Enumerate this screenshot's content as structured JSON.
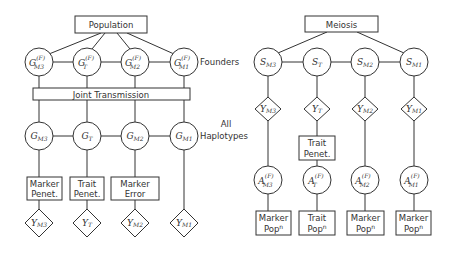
{
  "left": {
    "top_box": "Population",
    "founders_label": "Founders",
    "joint_box": "Joint Transmission",
    "all_label_1": "All",
    "all_label_2": "Haplotypes",
    "founder_nodes": [
      {
        "base": "G",
        "sup": "(F)",
        "sub": "M3"
      },
      {
        "base": "G",
        "sup": "(F)",
        "sub": "T"
      },
      {
        "base": "G",
        "sup": "(F)",
        "sub": "M2"
      },
      {
        "base": "G",
        "sup": "(F)",
        "sub": "M1"
      }
    ],
    "haplotype_nodes": [
      {
        "base": "G",
        "sub": "M3"
      },
      {
        "base": "G",
        "sub": "T"
      },
      {
        "base": "G",
        "sub": "M2"
      },
      {
        "base": "G",
        "sub": "M1"
      }
    ],
    "penet_boxes": [
      {
        "line1": "Marker",
        "line2": "Penet."
      },
      {
        "line1": "Trait",
        "line2": "Penet."
      },
      {
        "line1": "Marker",
        "line2": "Error"
      }
    ],
    "obs_nodes": [
      {
        "base": "Y",
        "sub": "M3"
      },
      {
        "base": "Y",
        "sub": "T"
      },
      {
        "base": "Y",
        "sub": "M2"
      },
      {
        "base": "Y",
        "sub": "M1"
      }
    ]
  },
  "right": {
    "top_box": "Meiosis",
    "s_nodes": [
      {
        "base": "S",
        "sub": "M3"
      },
      {
        "base": "S",
        "sub": "T"
      },
      {
        "base": "S",
        "sub": "M2"
      },
      {
        "base": "S",
        "sub": "M1"
      }
    ],
    "obs_nodes": [
      {
        "base": "Y",
        "sub": "M3"
      },
      {
        "base": "Y",
        "sub": "T"
      },
      {
        "base": "Y",
        "sub": "M2"
      },
      {
        "base": "Y",
        "sub": "M1"
      }
    ],
    "trait_penet": {
      "line1": "Trait",
      "line2": "Penet."
    },
    "a_nodes": [
      {
        "base": "A",
        "sup": "(F)",
        "sub": "M3"
      },
      {
        "base": "A",
        "sup": "(F)",
        "sub": "T"
      },
      {
        "base": "A",
        "sup": "(F)",
        "sub": "M2"
      },
      {
        "base": "A",
        "sup": "(F)",
        "sub": "M1"
      }
    ],
    "pop_boxes": [
      {
        "line1": "Marker",
        "line2": "Pop",
        "sup": "n"
      },
      {
        "line1": "Trait",
        "line2": "Pop",
        "sup": "n"
      },
      {
        "line1": "Marker",
        "line2": "Pop",
        "sup": "n"
      },
      {
        "line1": "Marker",
        "line2": "Pop",
        "sup": "n"
      }
    ]
  }
}
